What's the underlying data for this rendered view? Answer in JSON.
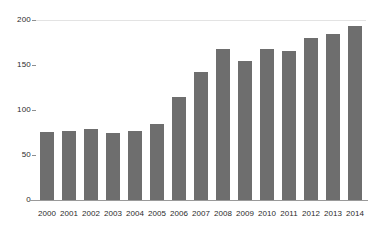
{
  "chart_data": {
    "type": "bar",
    "title": "",
    "subtitle": "",
    "xlabel": "",
    "ylabel": "",
    "categories": [
      "2000",
      "2001",
      "2002",
      "2003",
      "2004",
      "2005",
      "2006",
      "2007",
      "2008",
      "2009",
      "2010",
      "2011",
      "2012",
      "2013",
      "2014"
    ],
    "values": [
      76,
      77,
      79,
      74,
      77,
      85,
      115,
      142,
      168,
      154,
      168,
      166,
      180,
      184,
      193
    ],
    "ylim": [
      0,
      200
    ],
    "yticks": [
      0,
      50,
      100,
      150,
      200
    ],
    "ytick_labels": [
      "0",
      "50",
      "100",
      "150",
      "200"
    ],
    "grid": "top-gridline-only",
    "legend": "none",
    "series": [
      {
        "name": "",
        "color": "#6e6e6e",
        "values": [
          76,
          77,
          79,
          74,
          77,
          85,
          115,
          142,
          168,
          154,
          168,
          166,
          180,
          184,
          193
        ]
      }
    ]
  },
  "colors": {
    "bar": "#6e6e6e",
    "axis": "#9a9a9a",
    "gridline": "#e3e3e3",
    "text": "#2b2b2b",
    "background": "#ffffff"
  }
}
